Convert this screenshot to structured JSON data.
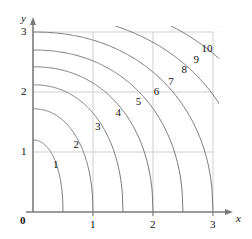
{
  "chart_data": {
    "type": "line",
    "title": "",
    "subtitle": "",
    "xlabel": "x",
    "ylabel": "y",
    "xlim": [
      0,
      3
    ],
    "ylim": [
      0,
      3
    ],
    "grid": true,
    "legend": "none",
    "x_ticks": [
      "0",
      "1",
      "2",
      "3"
    ],
    "x_tick_values": [
      0,
      1,
      2,
      3
    ],
    "y_ticks": [
      "0",
      "1",
      "2",
      "3"
    ],
    "y_tick_values": [
      0,
      1,
      2,
      3
    ],
    "origin_label": "0",
    "contours": [
      {
        "level": 1,
        "label": "1",
        "label_x": 0.38,
        "label_y": 0.78,
        "y_intercept": 1.2,
        "x_intercept": 0.5
      },
      {
        "level": 2,
        "label": "2",
        "label_x": 0.72,
        "label_y": 1.12,
        "y_intercept": 1.72,
        "x_intercept": 1.0
      },
      {
        "level": 3,
        "label": "3",
        "label_x": 1.08,
        "label_y": 1.42,
        "y_intercept": 2.12,
        "x_intercept": 1.5
      },
      {
        "level": 4,
        "label": "4",
        "label_x": 1.42,
        "label_y": 1.65,
        "y_intercept": 2.42,
        "x_intercept": 2.0
      },
      {
        "level": 5,
        "label": "5",
        "label_x": 1.76,
        "label_y": 1.84,
        "y_intercept": 2.7,
        "x_intercept": 2.5
      },
      {
        "level": 6,
        "label": "6",
        "label_x": 2.06,
        "label_y": 2.0,
        "y_intercept": 3.0,
        "x_intercept": 3.0
      },
      {
        "level": 7,
        "label": "7",
        "label_x": 2.3,
        "label_y": 2.17,
        "y_intercept": 3.3,
        "x_intercept": 3.6
      },
      {
        "level": 8,
        "label": "8",
        "label_x": 2.52,
        "label_y": 2.36,
        "y_intercept": 3.6,
        "x_intercept": 4.2
      },
      {
        "level": 9,
        "label": "9",
        "label_x": 2.72,
        "label_y": 2.54,
        "y_intercept": 3.9,
        "x_intercept": 4.8
      },
      {
        "level": 10,
        "label": "10",
        "label_x": 2.9,
        "label_y": 2.72,
        "y_intercept": 4.2,
        "x_intercept": 5.4
      }
    ],
    "colors": {
      "curve": "#6b6b6b",
      "axis": "#7a7a7a",
      "grid": "#cfcfcf",
      "text": "#111111",
      "background": "#ffffff"
    }
  }
}
